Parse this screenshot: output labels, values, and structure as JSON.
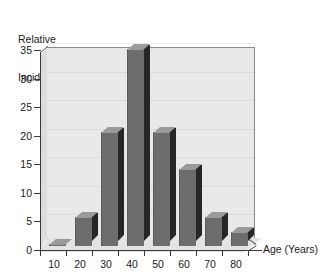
{
  "chart_data": {
    "type": "bar",
    "title": "",
    "subtitle": "",
    "xlabel": "Age (Years)",
    "ylabel": "Relative Incidence",
    "ylabel_lines": [
      "Relative",
      "Incidence"
    ],
    "categories": [
      "10",
      "20",
      "30",
      "40",
      "50",
      "60",
      "70",
      "80"
    ],
    "values": [
      0,
      5,
      20,
      34.5,
      20,
      13.5,
      5,
      2.5
    ],
    "ylim": [
      0,
      35
    ],
    "yticks": [
      0,
      5,
      10,
      15,
      20,
      25,
      30,
      35
    ],
    "ytick_labels": [
      "0",
      "5",
      "10",
      "15",
      "20",
      "25",
      "30",
      "35"
    ],
    "xtick_labels": [
      "10",
      "20",
      "30",
      "40",
      "50",
      "60",
      "70",
      "80"
    ],
    "grid": false,
    "legend": null,
    "legend_position": "none",
    "style": "3d-bar",
    "annotations": []
  },
  "colors": {
    "bar_front": "#6d6d6d",
    "bar_side": "#262626",
    "bar_top": "#9a9a9a",
    "plot_background": "#e9e9e9",
    "left_wall": "#dcdcdc",
    "floor": "#e3e3e3",
    "axis": "#3a3a3a",
    "text": "#1a1a1a",
    "page_background": "#ffffff"
  },
  "geometry": {
    "plot_left": 47,
    "plot_right": 255,
    "plot_top": 47,
    "baseline_y": 250,
    "value_top_y": 50,
    "depth": 7
  }
}
